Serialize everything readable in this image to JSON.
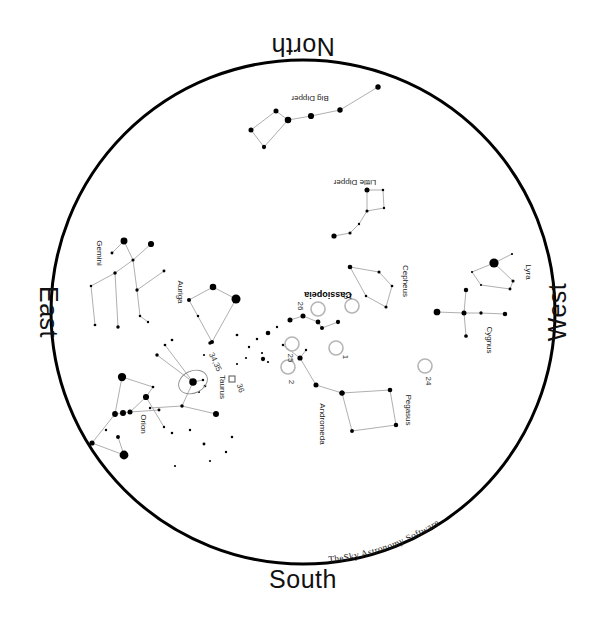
{
  "app": {
    "title": "TheSky Astronomy Software",
    "watermark": "TheSky Astronomy Software"
  },
  "canvas": {
    "width": 607,
    "height": 625,
    "background": "#ffffff"
  },
  "horizon": {
    "label": "horizon-circle",
    "cx": 303,
    "cy": 312,
    "r": 252,
    "stroke": "#000000",
    "stroke_width": 3
  },
  "cardinals": [
    {
      "name": "north",
      "label": "North",
      "x": 303,
      "y": 38,
      "rotation": 180
    },
    {
      "name": "south",
      "label": "South",
      "x": 303,
      "y": 588,
      "rotation": 0
    },
    {
      "name": "east",
      "label": "East",
      "x": 40,
      "y": 312,
      "rotation": 90
    },
    {
      "name": "west",
      "label": "West",
      "x": 566,
      "y": 312,
      "rotation": -90
    }
  ],
  "chart_data": {
    "type": "scatter",
    "xlabel": "",
    "ylabel": "",
    "projection": "zenithal-horizon",
    "grid": false,
    "legend": "none",
    "star_color": "#000000",
    "constellation_line_color": "#9a9a9a",
    "object_marker": {
      "shape": "open-circle",
      "stroke": "#b5b5b5",
      "radius": 7
    },
    "constellations": [
      {
        "name": "Big Dipper",
        "label": "Big Dipper",
        "label_x": 310,
        "label_y": 96,
        "label_rotation": 180,
        "bold": false,
        "stars": [
          {
            "x": 378,
            "y": 87,
            "mag": 2.0
          },
          {
            "x": 340,
            "y": 110,
            "mag": 2.0
          },
          {
            "x": 311,
            "y": 116,
            "mag": 1.6
          },
          {
            "x": 288,
            "y": 120,
            "mag": 1.4
          },
          {
            "x": 276,
            "y": 111,
            "mag": 2.2
          },
          {
            "x": 251,
            "y": 130,
            "mag": 2.2
          },
          {
            "x": 264,
            "y": 147,
            "mag": 2.6
          }
        ],
        "lines": [
          [
            0,
            1
          ],
          [
            1,
            2
          ],
          [
            2,
            3
          ],
          [
            3,
            4
          ],
          [
            4,
            5
          ],
          [
            5,
            6
          ],
          [
            6,
            3
          ]
        ]
      },
      {
        "name": "Little Dipper",
        "label": "Little Dipper",
        "label_x": 355,
        "label_y": 180,
        "label_rotation": 180,
        "bold": false,
        "stars": [
          {
            "x": 367,
            "y": 190,
            "mag": 2.2
          },
          {
            "x": 383,
            "y": 190,
            "mag": 3.5
          },
          {
            "x": 384,
            "y": 208,
            "mag": 3.6
          },
          {
            "x": 367,
            "y": 211,
            "mag": 3.2
          },
          {
            "x": 359,
            "y": 224,
            "mag": 3.6
          },
          {
            "x": 350,
            "y": 233,
            "mag": 3.2
          },
          {
            "x": 334,
            "y": 236,
            "mag": 2.1
          }
        ],
        "lines": [
          [
            0,
            1
          ],
          [
            1,
            2
          ],
          [
            2,
            3
          ],
          [
            3,
            0
          ],
          [
            3,
            4
          ],
          [
            4,
            5
          ],
          [
            5,
            6
          ]
        ]
      },
      {
        "name": "Gemini",
        "label": "Gemini",
        "label_x": 97,
        "label_y": 253,
        "label_rotation": 90,
        "bold": false,
        "stars": [
          {
            "x": 124,
            "y": 241,
            "mag": 1.2
          },
          {
            "x": 151,
            "y": 244,
            "mag": 1.6
          },
          {
            "x": 112,
            "y": 253,
            "mag": 3.3
          },
          {
            "x": 133,
            "y": 260,
            "mag": 3.2
          },
          {
            "x": 115,
            "y": 273,
            "mag": 3.0
          },
          {
            "x": 164,
            "y": 271,
            "mag": 3.3
          },
          {
            "x": 91,
            "y": 286,
            "mag": 3.5
          },
          {
            "x": 95,
            "y": 325,
            "mag": 3.4
          },
          {
            "x": 118,
            "y": 327,
            "mag": 3.0
          },
          {
            "x": 137,
            "y": 290,
            "mag": 3.1
          },
          {
            "x": 140,
            "y": 316,
            "mag": 3.5
          },
          {
            "x": 148,
            "y": 322,
            "mag": 3.6
          }
        ],
        "lines": [
          [
            0,
            2
          ],
          [
            0,
            3
          ],
          [
            1,
            3
          ],
          [
            3,
            4
          ],
          [
            4,
            6
          ],
          [
            6,
            7
          ],
          [
            4,
            8
          ],
          [
            3,
            9
          ],
          [
            9,
            5
          ],
          [
            9,
            10
          ],
          [
            10,
            11
          ]
        ]
      },
      {
        "name": "Auriga",
        "label": "Auriga",
        "label_x": 178,
        "label_y": 292,
        "label_rotation": 90,
        "bold": false,
        "stars": [
          {
            "x": 213,
            "y": 287,
            "mag": 1.4
          },
          {
            "x": 236,
            "y": 299,
            "mag": 0.1
          },
          {
            "x": 189,
            "y": 300,
            "mag": 2.7
          },
          {
            "x": 212,
            "y": 342,
            "mag": 2.7
          },
          {
            "x": 210,
            "y": 343,
            "mag": 3.0
          }
        ],
        "lines": [
          [
            0,
            1
          ],
          [
            0,
            2
          ],
          [
            2,
            3
          ],
          [
            3,
            1
          ]
        ]
      },
      {
        "name": "Taurus",
        "label": "Taurus",
        "label_x": 220,
        "label_y": 387,
        "label_rotation": 90,
        "bold": false,
        "stars": [
          {
            "x": 193,
            "y": 382,
            "mag": 0.9
          },
          {
            "x": 203,
            "y": 380,
            "mag": 3.5
          },
          {
            "x": 205,
            "y": 386,
            "mag": 3.4
          },
          {
            "x": 199,
            "y": 392,
            "mag": 3.8
          },
          {
            "x": 182,
            "y": 406,
            "mag": 3.0
          },
          {
            "x": 216,
            "y": 414,
            "mag": 1.7
          },
          {
            "x": 150,
            "y": 408,
            "mag": 3.6
          },
          {
            "x": 165,
            "y": 345,
            "mag": 3.4
          },
          {
            "x": 157,
            "y": 355,
            "mag": 3.0
          }
        ],
        "lines": [
          [
            0,
            1
          ],
          [
            0,
            4
          ],
          [
            4,
            5
          ],
          [
            0,
            7
          ],
          [
            0,
            8
          ],
          [
            4,
            6
          ]
        ]
      },
      {
        "name": "Orion",
        "label": "Orion",
        "label_x": 141,
        "label_y": 424,
        "label_rotation": 90,
        "bold": false,
        "stars": [
          {
            "x": 122,
            "y": 377,
            "mag": 0.5
          },
          {
            "x": 153,
            "y": 387,
            "mag": 3.4
          },
          {
            "x": 146,
            "y": 397,
            "mag": 1.6
          },
          {
            "x": 115,
            "y": 414,
            "mag": 1.8
          },
          {
            "x": 123,
            "y": 413,
            "mag": 1.7
          },
          {
            "x": 130,
            "y": 412,
            "mag": 2.2
          },
          {
            "x": 106,
            "y": 430,
            "mag": 3.6
          },
          {
            "x": 92,
            "y": 443,
            "mag": 2.1
          },
          {
            "x": 118,
            "y": 437,
            "mag": 2.8
          },
          {
            "x": 124,
            "y": 455,
            "mag": 0.2
          },
          {
            "x": 159,
            "y": 410,
            "mag": 3.3
          },
          {
            "x": 164,
            "y": 427,
            "mag": 3.6
          }
        ],
        "lines": [
          [
            0,
            1
          ],
          [
            0,
            3
          ],
          [
            3,
            4
          ],
          [
            4,
            5
          ],
          [
            5,
            2
          ],
          [
            2,
            1
          ],
          [
            5,
            10
          ],
          [
            3,
            7
          ],
          [
            7,
            9
          ],
          [
            9,
            8
          ],
          [
            2,
            11
          ]
        ]
      },
      {
        "name": "Cassiopeia",
        "label": "Cassiopeia",
        "label_x": 328,
        "label_y": 292,
        "label_rotation": 180,
        "bold": true,
        "stars": [
          {
            "x": 290,
            "y": 320,
            "mag": 2.2
          },
          {
            "x": 303,
            "y": 316,
            "mag": 2.2
          },
          {
            "x": 318,
            "y": 322,
            "mag": 2.3
          },
          {
            "x": 322,
            "y": 328,
            "mag": 2.7
          },
          {
            "x": 338,
            "y": 322,
            "mag": 2.6
          }
        ],
        "lines": [
          [
            0,
            1
          ],
          [
            1,
            2
          ],
          [
            2,
            3
          ],
          [
            3,
            4
          ]
        ]
      },
      {
        "name": "Cepheus",
        "label": "Cepheus",
        "label_x": 403,
        "label_y": 281,
        "label_rotation": 90,
        "bold": false,
        "stars": [
          {
            "x": 350,
            "y": 267,
            "mag": 2.4
          },
          {
            "x": 379,
            "y": 272,
            "mag": 3.2
          },
          {
            "x": 392,
            "y": 286,
            "mag": 3.4
          },
          {
            "x": 386,
            "y": 307,
            "mag": 3.2
          },
          {
            "x": 366,
            "y": 296,
            "mag": 3.5
          }
        ],
        "lines": [
          [
            0,
            1
          ],
          [
            1,
            2
          ],
          [
            2,
            3
          ],
          [
            3,
            4
          ],
          [
            4,
            0
          ]
        ]
      },
      {
        "name": "Andromeda",
        "label": "Andromeda",
        "label_x": 320,
        "label_y": 424,
        "label_rotation": 90,
        "bold": false,
        "stars": [
          {
            "x": 300,
            "y": 358,
            "mag": 2.1
          },
          {
            "x": 316,
            "y": 385,
            "mag": 2.2
          },
          {
            "x": 342,
            "y": 393,
            "mag": 2.2
          },
          {
            "x": 283,
            "y": 345,
            "mag": 3.5
          },
          {
            "x": 306,
            "y": 350,
            "mag": 3.6
          }
        ],
        "lines": [
          [
            0,
            1
          ],
          [
            1,
            2
          ],
          [
            0,
            3
          ],
          [
            0,
            4
          ]
        ]
      },
      {
        "name": "Pegasus",
        "label": "Pegasus",
        "label_x": 406,
        "label_y": 410,
        "label_rotation": 90,
        "bold": false,
        "stars": [
          {
            "x": 342,
            "y": 393,
            "mag": 2.1
          },
          {
            "x": 390,
            "y": 390,
            "mag": 2.4
          },
          {
            "x": 396,
            "y": 425,
            "mag": 2.5
          },
          {
            "x": 352,
            "y": 431,
            "mag": 2.8
          }
        ],
        "lines": [
          [
            0,
            1
          ],
          [
            1,
            2
          ],
          [
            2,
            3
          ],
          [
            3,
            0
          ]
        ]
      },
      {
        "name": "Cygnus",
        "label": "Cygnus",
        "label_x": 487,
        "label_y": 340,
        "label_rotation": 90,
        "bold": false,
        "stars": [
          {
            "x": 437,
            "y": 312,
            "mag": 1.3
          },
          {
            "x": 464,
            "y": 313,
            "mag": 2.2
          },
          {
            "x": 481,
            "y": 313,
            "mag": 3.1
          },
          {
            "x": 505,
            "y": 314,
            "mag": 2.5
          },
          {
            "x": 466,
            "y": 290,
            "mag": 2.5
          },
          {
            "x": 466,
            "y": 336,
            "mag": 2.9
          }
        ],
        "lines": [
          [
            0,
            1
          ],
          [
            1,
            2
          ],
          [
            2,
            3
          ],
          [
            4,
            1
          ],
          [
            1,
            5
          ]
        ]
      },
      {
        "name": "Lyra",
        "label": "Lyra",
        "label_x": 526,
        "label_y": 272,
        "label_rotation": 90,
        "bold": false,
        "stars": [
          {
            "x": 494,
            "y": 263,
            "mag": 0.0
          },
          {
            "x": 513,
            "y": 281,
            "mag": 3.2
          },
          {
            "x": 510,
            "y": 289,
            "mag": 3.3
          },
          {
            "x": 481,
            "y": 285,
            "mag": 4.2
          },
          {
            "x": 472,
            "y": 272,
            "mag": 4.3
          },
          {
            "x": 512,
            "y": 254,
            "mag": 4.3
          }
        ],
        "lines": [
          [
            0,
            1
          ],
          [
            1,
            2
          ],
          [
            2,
            3
          ],
          [
            3,
            4
          ],
          [
            4,
            0
          ],
          [
            0,
            5
          ]
        ]
      }
    ],
    "field_stars": [
      {
        "x": 237,
        "y": 335,
        "mag": 3.4
      },
      {
        "x": 249,
        "y": 347,
        "mag": 3.6
      },
      {
        "x": 257,
        "y": 339,
        "mag": 3.5
      },
      {
        "x": 262,
        "y": 353,
        "mag": 3.8
      },
      {
        "x": 268,
        "y": 333,
        "mag": 2.4
      },
      {
        "x": 277,
        "y": 327,
        "mag": 3.6
      },
      {
        "x": 246,
        "y": 358,
        "mag": 3.9
      },
      {
        "x": 237,
        "y": 364,
        "mag": 4.0
      },
      {
        "x": 263,
        "y": 359,
        "mag": 2.6
      },
      {
        "x": 268,
        "y": 362,
        "mag": 3.9
      },
      {
        "x": 172,
        "y": 433,
        "mag": 3.5
      },
      {
        "x": 190,
        "y": 430,
        "mag": 3.6
      },
      {
        "x": 204,
        "y": 444,
        "mag": 3.3
      },
      {
        "x": 232,
        "y": 437,
        "mag": 3.5
      },
      {
        "x": 210,
        "y": 461,
        "mag": 3.8
      },
      {
        "x": 175,
        "y": 466,
        "mag": 3.9
      },
      {
        "x": 226,
        "y": 452,
        "mag": 3.6
      },
      {
        "x": 198,
        "y": 316,
        "mag": 3.5
      },
      {
        "x": 172,
        "y": 340,
        "mag": 3.4
      },
      {
        "x": 204,
        "y": 355,
        "mag": 3.7
      }
    ],
    "objects": [
      {
        "id": "1",
        "x": 336,
        "y": 348,
        "label": "1",
        "label_x": 343,
        "label_y": 357,
        "label_rotation": 90
      },
      {
        "id": "2",
        "x": 288,
        "y": 367,
        "label": "2",
        "label_x": 289,
        "label_y": 382,
        "label_rotation": 90
      },
      {
        "id": "10",
        "x": 352,
        "y": 306,
        "label": "10",
        "label_x": 348,
        "label_y": 294,
        "label_rotation": 180
      },
      {
        "id": "24",
        "x": 425,
        "y": 366,
        "label": "24",
        "label_x": 426,
        "label_y": 381,
        "label_rotation": 90
      },
      {
        "id": "25",
        "x": 292,
        "y": 344,
        "label": "25",
        "label_x": 288,
        "label_y": 358,
        "label_rotation": 90
      },
      {
        "id": "26",
        "x": 318,
        "y": 309,
        "label": "26",
        "label_x": 298,
        "label_y": 306,
        "label_rotation": 90
      },
      {
        "id": "34,35",
        "x": 193,
        "y": 382,
        "label": "34,35",
        "label_x": 213,
        "label_y": 363,
        "label_rotation": 65,
        "marker": "ellipse"
      },
      {
        "id": "36",
        "x": 232,
        "y": 379,
        "label": "36",
        "label_x": 238,
        "label_y": 389,
        "label_rotation": 70,
        "marker": "small-square"
      }
    ]
  }
}
